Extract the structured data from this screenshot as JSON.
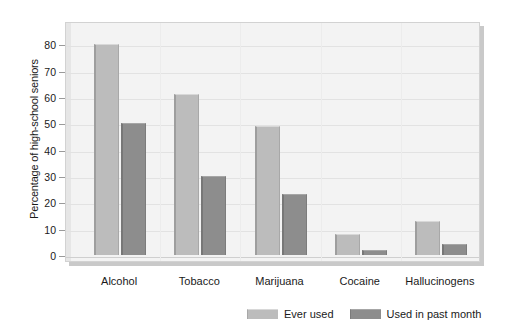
{
  "chart_data": {
    "type": "bar",
    "title": "",
    "xlabel": "",
    "ylabel": "Percentage of high-school seniors",
    "ylim": [
      0,
      85
    ],
    "yticks": [
      0,
      10,
      20,
      30,
      40,
      50,
      60,
      70,
      80
    ],
    "grid": true,
    "legend_position": "bottom",
    "categories": [
      "Alcohol",
      "Tobacco",
      "Marijuana",
      "Cocaine",
      "Hallucinogens"
    ],
    "series": [
      {
        "name": "Ever used",
        "color": "#bcbcbc",
        "values": [
          80,
          61,
          49,
          8,
          13
        ]
      },
      {
        "name": "Used in past month",
        "color": "#8d8d8d",
        "values": [
          50,
          30,
          23,
          2,
          4
        ]
      }
    ]
  },
  "axis": {
    "y_title": "Percentage of high-school seniors",
    "tick_labels": [
      "80",
      "70",
      "60",
      "50",
      "40",
      "30",
      "20",
      "10",
      "0"
    ]
  },
  "legend": {
    "items": [
      {
        "label": "Ever used"
      },
      {
        "label": "Used in past month"
      }
    ]
  },
  "colors": {
    "series_light": "#bcbcbc",
    "series_dark": "#8d8d8d",
    "plot_background": "#f3f3f3",
    "gridline": "#e2e2e2",
    "text": "#1a1a1a"
  }
}
